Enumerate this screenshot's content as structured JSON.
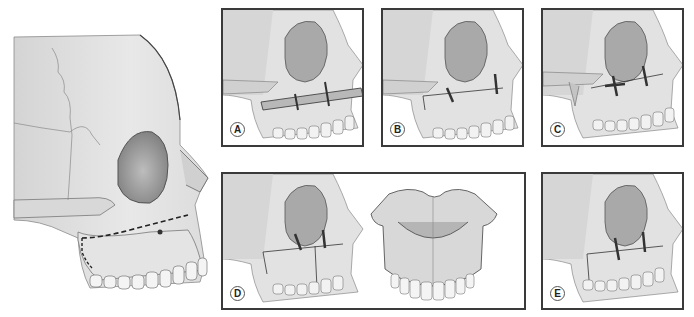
{
  "figure": {
    "main_view": {
      "osteotomy_line": "dashed",
      "line_color": "#222222"
    },
    "panels": [
      {
        "id": "A",
        "label": "A",
        "fixation": "bone graft strut with wires"
      },
      {
        "id": "B",
        "label": "B",
        "fixation": "wire ligatures"
      },
      {
        "id": "C",
        "label": "C",
        "fixation": "wire ligatures with pterygoid plate"
      },
      {
        "id": "D",
        "label": "D",
        "fixation": "wires with segmental cut, inferior palatal view"
      },
      {
        "id": "E",
        "label": "E",
        "fixation": "wire ligatures"
      }
    ]
  },
  "colors": {
    "bone_light": "#e6e6e6",
    "bone_mid": "#cfcfcf",
    "bone_shadow": "#9a9a9a",
    "outline": "#4a4a4a",
    "border": "#3a3a3a",
    "background": "#ffffff"
  }
}
